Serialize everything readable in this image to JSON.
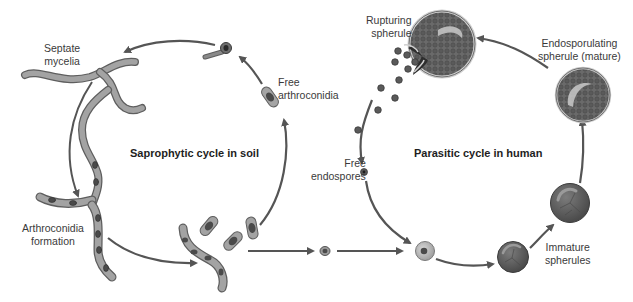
{
  "diagram": {
    "titles": {
      "saprophytic": "Saprophytic cycle in soil",
      "parasitic": "Parasitic cycle in human"
    },
    "labels": {
      "septate_mycelia_1": "Septate",
      "septate_mycelia_2": "mycelia",
      "free_arthroconidia_1": "Free",
      "free_arthroconidia_2": "arthroconidia",
      "arthroconidia_formation_1": "Arthroconidia",
      "arthroconidia_formation_2": "formation",
      "rupturing_spherule_1": "Rupturing",
      "rupturing_spherule_2": "spherule",
      "endosporulating_1": "Endosporulating",
      "endosporulating_2": "spherule (mature)",
      "free_endospores_1": "Free",
      "free_endospores_2": "endospores",
      "immature_spherules_1": "Immature",
      "immature_spherules_2": "spherules"
    },
    "colors": {
      "arrow": "#555555",
      "hypha_fill": "#9a9a9a",
      "hypha_stroke": "#5e5e5e",
      "spherule_fill": "#6a6a6a",
      "spherule_dark": "#3c3c3c",
      "highlight": "#c9c9c9"
    }
  }
}
